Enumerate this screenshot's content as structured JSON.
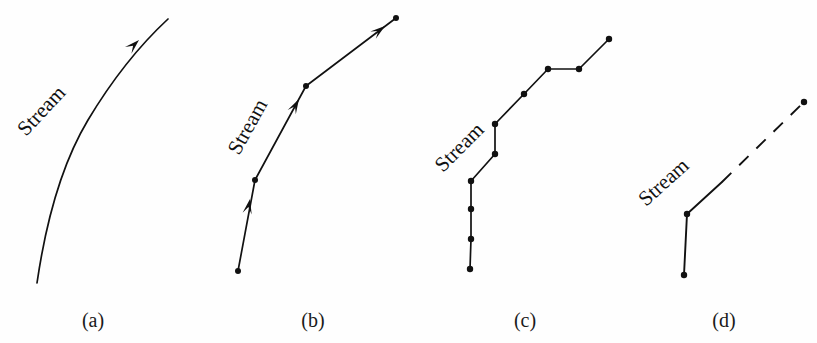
{
  "figure": {
    "background_color": "#fefefe",
    "ink_color": "#111111",
    "panels": [
      {
        "id": "a",
        "caption": "(a)",
        "caption_x": 93,
        "caption_y": 327,
        "label": "Stream",
        "label_x": 26,
        "label_y": 137,
        "label_rotation": -47,
        "representation": "continuous-curve",
        "has_arrowheads": true,
        "has_vertices": false,
        "dashed": false,
        "curve_path": "M 37 283 C 44 235 58 170 88 120 C 112 80 140 45 168 19",
        "arrowheads": [
          {
            "x": 139,
            "y": 40,
            "angle": -44
          }
        ],
        "vertices": []
      },
      {
        "id": "b",
        "caption": "(b)",
        "caption_x": 313,
        "caption_y": 327,
        "label": "Stream",
        "label_x": 239,
        "label_y": 156,
        "label_rotation": -61,
        "representation": "vector-segments",
        "has_arrowheads": true,
        "has_vertices": true,
        "dashed": false,
        "segments": [
          {
            "x1": 238,
            "y1": 271,
            "x2": 255,
            "y2": 180
          },
          {
            "x1": 255,
            "y1": 180,
            "x2": 306,
            "y2": 86
          },
          {
            "x1": 306,
            "y1": 86,
            "x2": 396,
            "y2": 18
          }
        ],
        "arrowheads": [
          {
            "x": 250,
            "y": 199,
            "angle": -79
          },
          {
            "x": 299,
            "y": 99,
            "angle": -61
          },
          {
            "x": 385,
            "y": 26,
            "angle": -37
          }
        ],
        "vertices": [
          {
            "x": 238,
            "y": 271
          },
          {
            "x": 255,
            "y": 180
          },
          {
            "x": 306,
            "y": 86
          },
          {
            "x": 396,
            "y": 18
          }
        ]
      },
      {
        "id": "c",
        "caption": "(c)",
        "caption_x": 525,
        "caption_y": 327,
        "label": "Stream",
        "label_x": 443,
        "label_y": 173,
        "label_rotation": -45,
        "representation": "dense-node-polyline",
        "has_arrowheads": false,
        "has_vertices": true,
        "dashed": false,
        "polyline": "470,269 471,239 471,209 471,181 495,154 495,124 524,94 548,69 579,69 609,39",
        "segments": [],
        "arrowheads": [],
        "vertices": [
          {
            "x": 470,
            "y": 269
          },
          {
            "x": 471,
            "y": 239
          },
          {
            "x": 471,
            "y": 209
          },
          {
            "x": 471,
            "y": 181
          },
          {
            "x": 495,
            "y": 154
          },
          {
            "x": 495,
            "y": 124
          },
          {
            "x": 524,
            "y": 94
          },
          {
            "x": 548,
            "y": 69
          },
          {
            "x": 579,
            "y": 69
          },
          {
            "x": 609,
            "y": 39
          }
        ]
      },
      {
        "id": "d",
        "caption": "(d)",
        "caption_x": 724,
        "caption_y": 327,
        "label": "Stream",
        "label_x": 646,
        "label_y": 207,
        "label_rotation": -42,
        "representation": "sparse-node-with-gap",
        "has_arrowheads": false,
        "has_vertices": true,
        "dashed": true,
        "solid_segments": [
          {
            "x1": 684,
            "y1": 275,
            "x2": 687,
            "y2": 214
          },
          {
            "x1": 687,
            "y1": 214,
            "x2": 722,
            "y2": 182
          }
        ],
        "dashed_segment": {
          "x1": 722,
          "y1": 182,
          "x2": 804,
          "y2": 102,
          "dash": "13 11"
        },
        "arrowheads": [],
        "vertices": [
          {
            "x": 684,
            "y": 275
          },
          {
            "x": 687,
            "y": 214
          },
          {
            "x": 804,
            "y": 102
          }
        ]
      }
    ]
  }
}
